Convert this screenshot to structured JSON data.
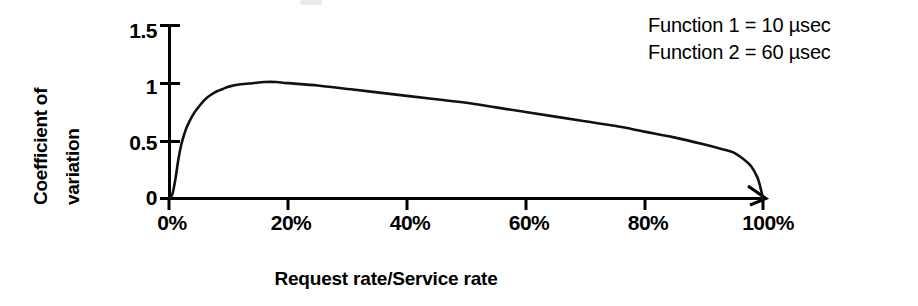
{
  "chart_data": {
    "type": "line",
    "title": "",
    "xlabel": "Request rate/Service rate",
    "ylabel": "Coefficient of variation",
    "ylabel_line1": "Coefficient of",
    "ylabel_line2": "variation",
    "xlim": [
      0,
      100
    ],
    "ylim": [
      0,
      1.5
    ],
    "grid": false,
    "legend_position": "top-right",
    "xticks": [
      0,
      20,
      40,
      60,
      80,
      100
    ],
    "xtick_labels": [
      "0%",
      "20%",
      "40%",
      "60%",
      "80%",
      "100%"
    ],
    "yticks": [
      0,
      0.5,
      1,
      1.5
    ],
    "ytick_labels": [
      "0",
      "0.5",
      "1",
      "1.5"
    ],
    "series": [
      {
        "name": "Coefficient of variation",
        "x": [
          0,
          0.5,
          1,
          1.5,
          2,
          2.5,
          3,
          4,
          5,
          6,
          7,
          8,
          9,
          10,
          12,
          14,
          16,
          18,
          20,
          25,
          30,
          35,
          40,
          45,
          50,
          55,
          60,
          65,
          70,
          75,
          80,
          85,
          90,
          93,
          95,
          97,
          98,
          99,
          99.5,
          100
        ],
        "values": [
          0,
          0.04,
          0.17,
          0.34,
          0.47,
          0.56,
          0.63,
          0.73,
          0.8,
          0.86,
          0.9,
          0.93,
          0.95,
          0.97,
          0.99,
          1.0,
          1.01,
          1.01,
          1.0,
          0.98,
          0.95,
          0.92,
          0.89,
          0.86,
          0.83,
          0.79,
          0.75,
          0.71,
          0.67,
          0.63,
          0.58,
          0.53,
          0.47,
          0.43,
          0.4,
          0.33,
          0.28,
          0.19,
          0.11,
          0
        ]
      }
    ],
    "annotations": [
      "Function 1 = 10 µsec",
      "Function 2 = 60 µsec"
    ]
  },
  "legend": {
    "rows": [
      "Function 1 = 10 µsec",
      "Function 2 = 60 µsec"
    ]
  },
  "axes": {
    "y_title_line1": "Coefficient of",
    "y_title_line2": "variation",
    "x_title": "Request rate/Service rate",
    "y_tick_0": "0",
    "y_tick_1": "0.5",
    "y_tick_2": "1",
    "y_tick_3": "1.5",
    "x_tick_0": "0%",
    "x_tick_1": "20%",
    "x_tick_2": "40%",
    "x_tick_3": "60%",
    "x_tick_4": "80%",
    "x_tick_5": "100%"
  },
  "colors": {
    "curve": "#111111",
    "axis": "#000000",
    "background": "#ffffff"
  }
}
